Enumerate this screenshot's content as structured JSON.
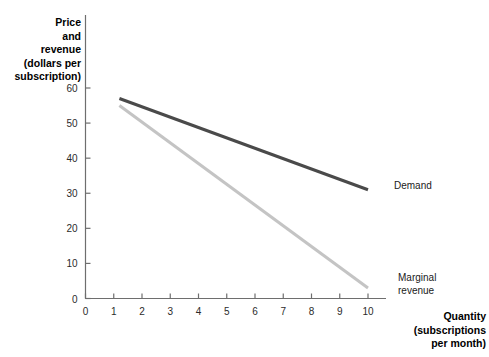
{
  "chart_data": {
    "type": "line",
    "title": "",
    "xlabel": "Quantity (subscriptions per month)",
    "ylabel": "Price and revenue (dollars per subscription)",
    "xlim": [
      0,
      10.6
    ],
    "ylim": [
      0,
      62
    ],
    "xticks": [
      0,
      1,
      2,
      3,
      4,
      5,
      6,
      7,
      8,
      9,
      10
    ],
    "yticks": [
      0,
      10,
      20,
      30,
      40,
      50,
      60
    ],
    "grid": false,
    "legend_position": "inline-right",
    "series": [
      {
        "name": "Demand",
        "color": "#4a4a4a",
        "x": [
          1.2,
          10
        ],
        "values": [
          57,
          31
        ]
      },
      {
        "name": "Marginal revenue",
        "color": "#c4c4c4",
        "x": [
          1.2,
          10
        ],
        "values": [
          55,
          3
        ]
      }
    ]
  },
  "axes": {
    "y_title_lines": [
      "Price",
      "and",
      "revenue",
      "(dollars per",
      "subscription)"
    ],
    "x_title_lines": [
      "Quantity",
      "(subscriptions",
      "per month)"
    ],
    "y_tick_labels": [
      "60",
      "50",
      "40",
      "30",
      "20",
      "10",
      "0"
    ],
    "x_tick_labels": [
      "0",
      "1",
      "2",
      "3",
      "4",
      "5",
      "6",
      "7",
      "8",
      "9",
      "10"
    ],
    "axis_color": "#6e6e6e"
  },
  "series_labels": {
    "demand": "Demand",
    "marginal_revenue_lines": [
      "Marginal",
      "revenue"
    ]
  }
}
